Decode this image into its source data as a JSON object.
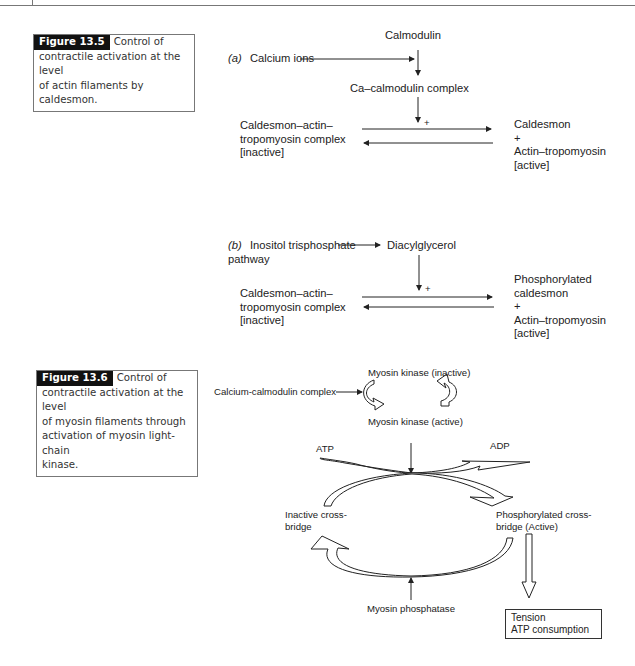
{
  "figure_13_5": {
    "caption_label": "Figure 13.5",
    "caption_line1": "Control of",
    "caption_line2": "contractile activation at the level",
    "caption_line3": "of actin filaments by caldesmon.",
    "part_a": {
      "label": "(a)",
      "input": "Calcium ions",
      "top": "Calmodulin",
      "intermediate": "Ca–calmodulin complex",
      "plus": "+",
      "left_l1": "Caldesmon–actin–",
      "left_l2": "tropomyosin complex",
      "left_l3": "[inactive]",
      "right_l1": "Caldesmon",
      "right_l2": "+",
      "right_l3": "Actin–tropomyosin",
      "right_l4": "[active]"
    },
    "part_b": {
      "label": "(b)",
      "input_l1": "Inositol trisphosphate",
      "input_l2": "pathway",
      "intermediate": "Diacylglycerol",
      "plus": "+",
      "left_l1": "Caldesmon–actin–",
      "left_l2": "tropomyosin complex",
      "left_l3": "[inactive]",
      "right_l1": "Phosphorylated",
      "right_l2": "caldesmon",
      "right_l3": "+",
      "right_l4": "Actin–tropomyosin",
      "right_l5": "[active]"
    }
  },
  "figure_13_6": {
    "caption_label": "Figure 13.6",
    "caption_line1": "Control of",
    "caption_line2": "contractile activation at the level",
    "caption_line3": "of myosin filaments through",
    "caption_line4": "activation of myosin light-chain",
    "caption_line5": "kinase.",
    "input": "Calcium-calmodulin complex",
    "kinase_inactive": "Myosin kinase (inactive)",
    "kinase_active": "Myosin kinase (active)",
    "atp": "ATP",
    "adp": "ADP",
    "inactive_l1": "Inactive cross-",
    "inactive_l2": "bridge",
    "phos_l1": "Phosphorylated cross-",
    "phos_l2": "bridge (Active)",
    "phosphatase": "Myosin phosphatase",
    "outcome_l1": "Tension",
    "outcome_l2": "ATP consumption"
  }
}
